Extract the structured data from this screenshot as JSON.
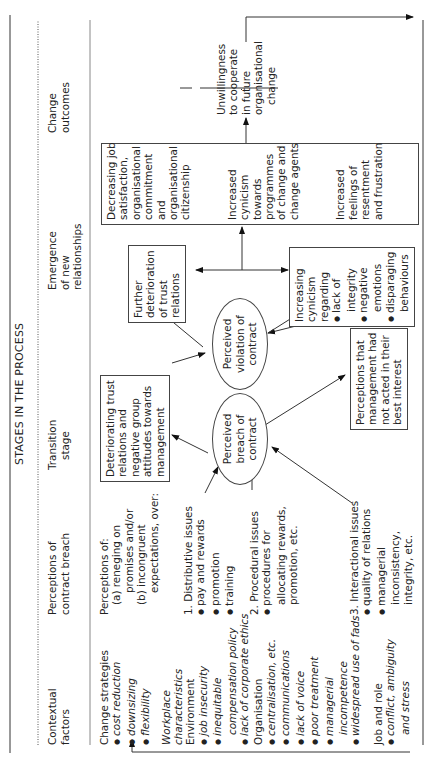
{
  "title": "STAGES IN THE PROCESS",
  "columns": [
    {
      "line1": "Contextual",
      "line2": "factors"
    },
    {
      "line1": "Perceptions of",
      "line2": "contract breach"
    },
    {
      "line1": "Transition",
      "line2": "stage"
    },
    {
      "line1": "Emergence",
      "line2": "of new",
      "line3": "relationships"
    },
    {
      "line1": "Change",
      "line2": "outcomes"
    }
  ],
  "contextual": {
    "change_strategies": "Change strategies",
    "cs_items": [
      "cost reduction",
      "downsizing",
      "flexibility"
    ],
    "workplace1": "Workplace",
    "workplace2": "characteristics",
    "environment": "Environment",
    "env_items": [
      "job insecurity",
      "inequitable",
      "compensation policy",
      "lack of corporate ethics"
    ],
    "organisation": "Organisation",
    "org_items": [
      "centralisation, etc.",
      "communications",
      "lack of voice",
      "poor treatment",
      "managerial",
      "incompetence",
      "widespread use of fads"
    ],
    "job_role": "Job and role",
    "jr_items": [
      "conflict, ambiguity",
      "and stress"
    ]
  },
  "perceptions": {
    "intro": "Perceptions of:",
    "a1": "(a) reneging on",
    "a2": "promises and/or",
    "b1": "(b) incongruent",
    "b2": "expectations, over:",
    "d_title": "1. Distributive issues",
    "d_items": [
      "pay and rewards",
      "promotion",
      "training"
    ],
    "p_title": "2. Procedural issues",
    "p_items": [
      "procedures for",
      "allocating rewards,",
      "promotion, etc."
    ],
    "i_title": "3. Interactional issues",
    "i_items": [
      "quality of relations",
      "managerial",
      "inconsistency,",
      "integrity, etc."
    ]
  },
  "transition": {
    "deteriorating": [
      "Deteriorating trust",
      "relations and",
      "negative group",
      "attitudes towards",
      "management"
    ],
    "breach": [
      "Perceived",
      "breach of",
      "contract"
    ],
    "not_acted": [
      "Perceptions that",
      "management had",
      "not acted in their",
      "best interest"
    ],
    "violation": [
      "Perceived",
      "violation of",
      "contract"
    ]
  },
  "emergence": {
    "further": [
      "Further",
      "deterioration",
      "of trust",
      "relations"
    ],
    "cynicism_title": [
      "Increasing",
      "cynicism",
      "regarding"
    ],
    "cynicism_items": [
      [
        "lack of",
        "integrity"
      ],
      [
        "negative",
        "emotions"
      ],
      [
        "disparaging",
        "behaviours"
      ]
    ],
    "big_box": {
      "g1": [
        "Decreasing job",
        "satisfaction,",
        "organisational",
        "commitment",
        "and",
        "organisational",
        "citizenship"
      ],
      "g2": [
        "Increased",
        "cynicism",
        "towards",
        "programmes",
        "of change and",
        "change agents"
      ],
      "g3": [
        "Increased",
        "feelings of",
        "resentment",
        "and frustration"
      ]
    }
  },
  "outcomes": {
    "text": [
      "Unwillingness",
      "to cooperate",
      "in future",
      "organisational",
      "change"
    ]
  }
}
